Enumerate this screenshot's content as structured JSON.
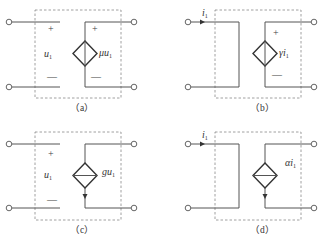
{
  "panels": [
    {
      "id": "a",
      "caption": "（a）",
      "type": "VCVS",
      "control_label": "u",
      "control_sub": "1",
      "source_label": "μu",
      "source_sub": "1",
      "plus": "+",
      "minus": "—"
    },
    {
      "id": "b",
      "caption": "（b）",
      "type": "CCVS",
      "control_label": "i",
      "control_sub": "1",
      "source_label": "γi",
      "source_sub": "1",
      "plus": "+",
      "minus": "—"
    },
    {
      "id": "c",
      "caption": "（c）",
      "type": "VCCS",
      "control_label": "u",
      "control_sub": "1",
      "source_label": "gu",
      "source_sub": "1",
      "plus": "+",
      "minus": "—"
    },
    {
      "id": "d",
      "caption": "（d）",
      "type": "CCCS",
      "control_label": "i",
      "control_sub": "1",
      "source_label": "αi",
      "source_sub": "1"
    }
  ]
}
